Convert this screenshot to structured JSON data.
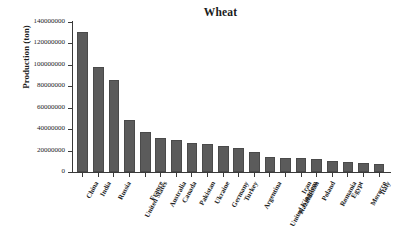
{
  "chart_data": {
    "type": "bar",
    "title": "Wheat",
    "xlabel": "",
    "ylabel": "Production (ton)",
    "ylim": [
      0,
      140000000
    ],
    "yticks": [
      0,
      20000000,
      40000000,
      60000000,
      80000000,
      100000000,
      120000000,
      140000000
    ],
    "ytick_labels": [
      "0",
      "20000000",
      "40000000",
      "60000000",
      "80000000",
      "100000000",
      "120000000",
      "140000000"
    ],
    "grid": false,
    "legend": "none",
    "bar_color": "#5b5b5b",
    "categories": [
      "China",
      "India",
      "Russia",
      "United States",
      "France",
      "Australia",
      "Canada",
      "Pakistan",
      "Ukraine",
      "Germany",
      "Turkey",
      "Argentina",
      "United Kingdom",
      "Kazakhstan",
      "Iran",
      "Poland",
      "Romania",
      "Egypt",
      "Morocco",
      "Italy"
    ],
    "values": [
      131000000,
      98000000,
      86000000,
      49000000,
      37000000,
      32000000,
      30000000,
      27000000,
      26000000,
      24000000,
      22000000,
      19000000,
      14000000,
      13000000,
      13000000,
      12000000,
      10000000,
      9000000,
      8000000,
      7500000
    ]
  }
}
